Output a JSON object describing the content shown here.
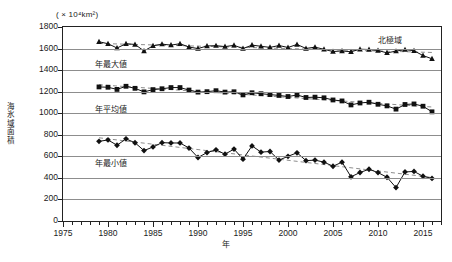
{
  "chart_data": {
    "type": "line",
    "title": "",
    "region_label": "北極域",
    "unit_label": "( × 10⁴km²)",
    "xlabel": "年",
    "ylabel": "海氷域面積",
    "xlim": [
      1975,
      2017
    ],
    "ylim": [
      0,
      1800
    ],
    "ytick_step": 200,
    "yticks": [
      0,
      200,
      400,
      600,
      800,
      1000,
      1200,
      1400,
      1600,
      1800
    ],
    "xticks_major": [
      1975,
      1980,
      1985,
      1990,
      1995,
      2000,
      2005,
      2010,
      2015
    ],
    "xtick_minor_step": 1,
    "grid": true,
    "legend_position": "inline-annotations",
    "x": [
      1979,
      1980,
      1981,
      1982,
      1983,
      1984,
      1985,
      1986,
      1987,
      1988,
      1989,
      1990,
      1991,
      1992,
      1993,
      1994,
      1995,
      1996,
      1997,
      1998,
      1999,
      2000,
      2001,
      2002,
      2003,
      2004,
      2005,
      2006,
      2007,
      2008,
      2009,
      2010,
      2011,
      2012,
      2013,
      2014,
      2015,
      2016
    ],
    "series": [
      {
        "name": "年最大値",
        "marker": "triangle",
        "color": "#111111",
        "trend": "dashed-linear",
        "values": [
          1663,
          1645,
          1605,
          1645,
          1638,
          1578,
          1625,
          1641,
          1632,
          1645,
          1614,
          1600,
          1624,
          1627,
          1618,
          1630,
          1600,
          1632,
          1621,
          1611,
          1628,
          1610,
          1638,
          1601,
          1613,
          1593,
          1572,
          1578,
          1570,
          1594,
          1591,
          1582,
          1560,
          1576,
          1590,
          1580,
          1535,
          1505
        ]
      },
      {
        "name": "年平均値",
        "marker": "square",
        "color": "#111111",
        "trend": "dashed-linear",
        "values": [
          1244,
          1241,
          1221,
          1250,
          1231,
          1198,
          1219,
          1227,
          1238,
          1238,
          1215,
          1196,
          1200,
          1209,
          1196,
          1199,
          1170,
          1190,
          1181,
          1173,
          1165,
          1155,
          1169,
          1146,
          1149,
          1143,
          1123,
          1114,
          1077,
          1095,
          1102,
          1083,
          1068,
          1038,
          1081,
          1086,
          1065,
          1013
        ]
      },
      {
        "name": "年最小値",
        "marker": "diamond",
        "color": "#111111",
        "trend": "dashed-linear",
        "values": [
          739,
          752,
          703,
          762,
          726,
          653,
          687,
          727,
          724,
          724,
          677,
          589,
          635,
          660,
          620,
          667,
          574,
          697,
          639,
          645,
          565,
          600,
          633,
          560,
          565,
          546,
          508,
          546,
          410,
          450,
          480,
          449,
          406,
          310,
          455,
          460,
          415,
          395
        ]
      }
    ]
  },
  "annotations": [
    {
      "name": "max-series-label",
      "text": "年最大値"
    },
    {
      "name": "mean-series-label",
      "text": "年平均値"
    },
    {
      "name": "min-series-label",
      "text": "年最小値"
    }
  ]
}
